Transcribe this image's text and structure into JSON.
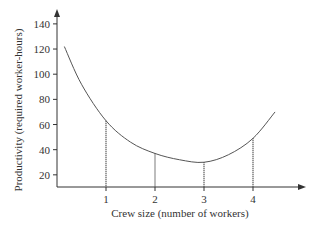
{
  "chart_data": {
    "type": "line",
    "title": "",
    "xlabel": "Crew size (number of workers)",
    "ylabel": "Productivity (required worker-hours)",
    "x_ticks": [
      "1",
      "2",
      "3",
      "4"
    ],
    "y_ticks": [
      "20",
      "40",
      "60",
      "80",
      "100",
      "120",
      "140"
    ],
    "ylim": [
      10,
      145
    ],
    "grid": false,
    "legend": null,
    "series": [
      {
        "name": "Productivity curve",
        "x": [
          0.15,
          0.5,
          1,
          1.5,
          2,
          2.5,
          3,
          3.5,
          4,
          4.45
        ],
        "values": [
          122,
          92,
          63,
          46,
          37,
          32,
          30,
          36,
          49,
          70
        ]
      }
    ],
    "annotations": [
      {
        "type": "dotted-drop-line",
        "x": 1,
        "y": 63
      },
      {
        "type": "dotted-drop-line",
        "x": 2,
        "y": 37
      },
      {
        "type": "dotted-drop-line",
        "x": 3,
        "y": 30
      },
      {
        "type": "dotted-drop-line",
        "x": 4,
        "y": 49
      }
    ]
  },
  "colors": {
    "axis": "#333333",
    "curve": "#555555",
    "drop_line": "#444444"
  }
}
